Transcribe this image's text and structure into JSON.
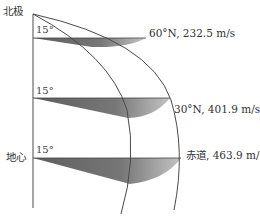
{
  "diagram": {
    "title": "",
    "axis_labels": {
      "north_pole": "北极",
      "earth_center": "地心"
    },
    "angle_labels": [
      "15°",
      "15°",
      "15°"
    ],
    "latitudes": [
      {
        "label": "60°N, 232.5 m/s",
        "latitude": "60°N",
        "speed": "232.5 m/s"
      },
      {
        "label": "30°N, 401.9 m/s",
        "latitude": "30°N",
        "speed": "401.9 m/s"
      },
      {
        "label": "赤道, 463.9 m/s",
        "latitude": "赤道",
        "speed": "463.9 m/s"
      }
    ],
    "colors": {
      "line": "#4a4a4a",
      "wedge_dark": "#6e6e6e",
      "wedge_light": "#b8b8b8",
      "text": "#333333"
    }
  }
}
